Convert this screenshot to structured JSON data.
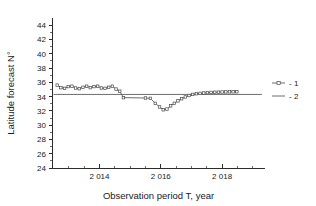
{
  "chart_data": {
    "type": "line",
    "title": "",
    "xlabel": "Observation period T, year",
    "ylabel": "Latitude forecast  N°",
    "xlim": [
      2012.45,
      2019.4
    ],
    "ylim": [
      24,
      45
    ],
    "grid": false,
    "legend_position": "right",
    "y_ticks": [
      24,
      26,
      28,
      30,
      32,
      34,
      36,
      38,
      40,
      42,
      44
    ],
    "y_tick_labels": [
      "24",
      "26",
      "28",
      "30",
      "32",
      "34",
      "36",
      "38",
      "40",
      "42",
      "44"
    ],
    "x_ticks": [
      2014,
      2016,
      2018
    ],
    "x_tick_labels": [
      "2 014",
      "2 016",
      "2 018"
    ],
    "x_minor_ticks": [
      2013,
      2013.5,
      2014.5,
      2015,
      2015.5,
      2016.5,
      2017,
      2017.5,
      2018.5,
      2019
    ],
    "series": [
      {
        "name": "1",
        "legend_label": "- 1",
        "marker": "square",
        "color": "#5b5b5b",
        "x": [
          2012.62,
          2012.74,
          2012.86,
          2012.98,
          2013.1,
          2013.22,
          2013.34,
          2013.46,
          2013.58,
          2013.7,
          2013.82,
          2013.94,
          2014.06,
          2014.18,
          2014.3,
          2014.42,
          2014.54,
          2014.66,
          2014.78,
          2015.5,
          2015.66,
          2015.82,
          2015.96,
          2016.08,
          2016.2,
          2016.32,
          2016.44,
          2016.56,
          2016.68,
          2016.8,
          2016.92,
          2017.04,
          2017.16,
          2017.28,
          2017.4,
          2017.52,
          2017.64,
          2017.76,
          2017.88,
          2018.0,
          2018.12,
          2018.24,
          2018.36,
          2018.48
        ],
        "y": [
          35.6,
          35.25,
          35.15,
          35.4,
          35.45,
          35.2,
          35.1,
          35.3,
          35.45,
          35.25,
          35.4,
          35.45,
          35.2,
          35.15,
          35.3,
          35.45,
          35.05,
          34.75,
          33.85,
          33.8,
          33.75,
          33.05,
          32.55,
          32.15,
          32.25,
          32.7,
          33.05,
          33.4,
          33.7,
          33.95,
          34.15,
          34.3,
          34.4,
          34.45,
          34.5,
          34.55,
          34.58,
          34.6,
          34.62,
          34.64,
          34.65,
          34.66,
          34.67,
          34.68
        ]
      },
      {
        "name": "2",
        "legend_label": "- 2",
        "marker": "none",
        "color": "#6e6e6e",
        "x": [
          2012.5,
          2019.3
        ],
        "y": [
          34.3,
          34.3
        ]
      }
    ]
  },
  "legend": {
    "entries": [
      {
        "label": "- 1",
        "marker": "square"
      },
      {
        "label": "- 2",
        "marker": "none"
      }
    ]
  }
}
